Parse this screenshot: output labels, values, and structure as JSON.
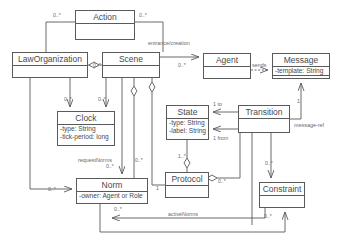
{
  "diagram": {
    "stroke_color": "#5a5a5a",
    "text_color": "#4a4a4a",
    "label_color": "#6a6a6a",
    "background": "#ffffff"
  },
  "classes": [
    {
      "id": "action",
      "name": "Action",
      "attributes": [],
      "x": 75,
      "y": 10,
      "w": 60,
      "h": 30
    },
    {
      "id": "law-organization",
      "name": "LawOrganization",
      "attributes": [],
      "x": 12,
      "y": 52,
      "w": 76,
      "h": 26
    },
    {
      "id": "scene",
      "name": "Scene",
      "attributes": [],
      "x": 102,
      "y": 52,
      "w": 58,
      "h": 26
    },
    {
      "id": "agent",
      "name": "Agent",
      "attributes": [],
      "x": 203,
      "y": 53,
      "w": 48,
      "h": 26
    },
    {
      "id": "message",
      "name": "Message",
      "attributes": [
        "-template: String"
      ],
      "x": 272,
      "y": 53,
      "w": 58,
      "h": 26
    },
    {
      "id": "clock",
      "name": "Clock",
      "attributes": [
        "-type: String",
        "-tick-period: long"
      ],
      "x": 57,
      "y": 111,
      "w": 58,
      "h": 35
    },
    {
      "id": "state",
      "name": "State",
      "attributes": [
        "-type: String",
        "-label: String"
      ],
      "x": 166,
      "y": 105,
      "w": 43,
      "h": 35
    },
    {
      "id": "transition",
      "name": "Transition",
      "attributes": [],
      "x": 238,
      "y": 105,
      "w": 52,
      "h": 28
    },
    {
      "id": "norm",
      "name": "Norm",
      "attributes": [
        "-owner: Agent or Role"
      ],
      "x": 76,
      "y": 178,
      "w": 72,
      "h": 26
    },
    {
      "id": "protocol",
      "name": "Protocol",
      "attributes": [],
      "x": 165,
      "y": 172,
      "w": 44,
      "h": 26
    },
    {
      "id": "constraint",
      "name": "Constraint",
      "attributes": [],
      "x": 259,
      "y": 182,
      "w": 46,
      "h": 26
    }
  ],
  "edge_labels": [
    {
      "id": "entrance-creation",
      "text": "entrance/creation",
      "x": 148,
      "y": 40
    },
    {
      "id": "sends",
      "text": "sends",
      "x": 252,
      "y": 62
    },
    {
      "id": "message-ref",
      "text": "message-ref",
      "x": 294,
      "y": 122
    },
    {
      "id": "to",
      "text": "1 to",
      "x": 213,
      "y": 101
    },
    {
      "id": "from",
      "text": "1 from",
      "x": 213,
      "y": 135
    },
    {
      "id": "request-norms",
      "text": "requestNorms",
      "x": 78,
      "y": 157
    },
    {
      "id": "active-norms",
      "text": "activeNorms",
      "x": 168,
      "y": 211
    }
  ],
  "multiplicities": [
    {
      "id": "action-left",
      "text": "0..*",
      "x": 53,
      "y": 12
    },
    {
      "id": "action-right",
      "text": "0..*",
      "x": 139,
      "y": 12
    },
    {
      "id": "scene-left",
      "text": "0..*",
      "x": 93,
      "y": 62
    },
    {
      "id": "agent-left",
      "text": "0..*",
      "x": 178,
      "y": 62
    },
    {
      "id": "clock-left",
      "text": "0..*",
      "x": 64,
      "y": 96
    },
    {
      "id": "clock-right",
      "text": "0..*",
      "x": 98,
      "y": 96
    },
    {
      "id": "norm-top",
      "text": "0..*",
      "x": 106,
      "y": 163
    },
    {
      "id": "norm-scene",
      "text": "0..*",
      "x": 135,
      "y": 157
    },
    {
      "id": "norm-left",
      "text": "0..*",
      "x": 48,
      "y": 186
    },
    {
      "id": "norm-bottom",
      "text": "0..*",
      "x": 114,
      "y": 206
    },
    {
      "id": "state-protocol",
      "text": "1..*",
      "x": 178,
      "y": 153
    },
    {
      "id": "protocol-left",
      "text": "1",
      "x": 156,
      "y": 185
    },
    {
      "id": "protocol-right",
      "text": "0..*",
      "x": 218,
      "y": 178
    },
    {
      "id": "constraint-top",
      "text": "0..*",
      "x": 265,
      "y": 160
    },
    {
      "id": "constraint-bottom",
      "text": "0..*",
      "x": 264,
      "y": 213
    },
    {
      "id": "message-bottom",
      "text": "1",
      "x": 297,
      "y": 98
    }
  ]
}
